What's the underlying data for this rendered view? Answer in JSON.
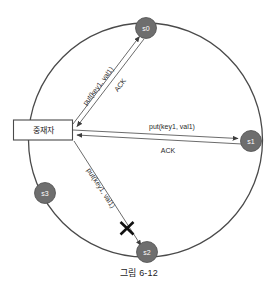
{
  "figure": {
    "caption": "그림 6-12",
    "coordinator": {
      "label": "중재자"
    },
    "nodes": [
      {
        "id": "s0",
        "label": "s0",
        "cx": 146,
        "cy": 28
      },
      {
        "id": "s1",
        "label": "s1",
        "cx": 251,
        "cy": 141
      },
      {
        "id": "s2",
        "label": "s2",
        "cx": 147,
        "cy": 252
      },
      {
        "id": "s3",
        "label": "s3",
        "cx": 45,
        "cy": 193
      }
    ],
    "edges": [
      {
        "id": "s0-request",
        "label": "put(key1, val1)",
        "from": "coordinator",
        "to": "s0",
        "status": "delivered"
      },
      {
        "id": "s0-ack",
        "label": "ACK",
        "from": "s0",
        "to": "coordinator",
        "status": "delivered"
      },
      {
        "id": "s1-request",
        "label": "put(key1, val1)",
        "from": "coordinator",
        "to": "s1",
        "status": "delivered"
      },
      {
        "id": "s1-ack",
        "label": "ACK",
        "from": "s1",
        "to": "coordinator",
        "status": "delivered"
      },
      {
        "id": "s2-request",
        "label": "put(key1, val1)",
        "from": "coordinator",
        "to": "s2",
        "status": "failed"
      }
    ],
    "failure_marker": {
      "name": "x-mark",
      "cx": 127,
      "cy": 228
    },
    "ring": {
      "cx": 145.5,
      "cy": 140,
      "r": 117
    },
    "colors": {
      "node_fill": "#6e6e6e",
      "node_text": "#ffffff",
      "ring_stroke": "#4a4a4a",
      "line_stroke": "#5a5a5a",
      "box_stroke": "#4a4a4a",
      "box_fill": "#ffffff",
      "text": "#1a1a1a",
      "failure": "#111111",
      "background": "#ffffff"
    }
  }
}
